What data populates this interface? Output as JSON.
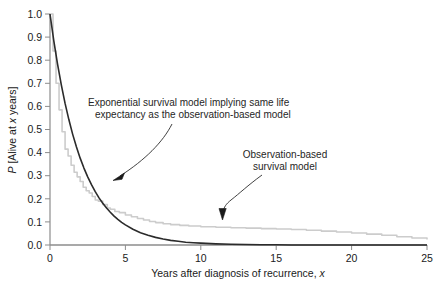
{
  "chart_data": {
    "type": "line",
    "title": "",
    "subtitle": "",
    "xlabel": "Years after diagnosis of recurrence, x",
    "ylabel": "P [Alive at x years]",
    "xlabel_parts": {
      "main": "Years after diagnosis of recurrence, ",
      "italic": "x"
    },
    "ylabel_parts": {
      "p": "P",
      "mid": " [Alive at ",
      "italic": "x",
      "end": " years]"
    },
    "xlim": [
      0,
      25
    ],
    "ylim": [
      0,
      1.0
    ],
    "xticks": [
      0,
      5,
      10,
      15,
      20,
      25
    ],
    "xtick_labels": [
      "0",
      "5",
      "10",
      "15",
      "20",
      "25"
    ],
    "yticks": [
      0.0,
      0.1,
      0.2,
      0.3,
      0.4,
      0.5,
      0.6,
      0.7,
      0.8,
      0.9,
      1.0
    ],
    "ytick_labels": [
      "0.0",
      "0.1",
      "0.2",
      "0.3",
      "0.4",
      "0.5",
      "0.6",
      "0.7",
      "0.8",
      "0.9",
      "1.0"
    ],
    "grid": false,
    "legend": "none",
    "series": [
      {
        "name": "Exponential survival model implying same life expectancy as the observation-based model",
        "color": "#2b2b2b",
        "style": "solid",
        "width": 1.6,
        "x": [
          0,
          0.25,
          0.5,
          0.75,
          1,
          1.25,
          1.5,
          1.75,
          2,
          2.25,
          2.5,
          2.75,
          3,
          3.25,
          3.5,
          3.75,
          4,
          4.25,
          4.5,
          4.75,
          5,
          5.5,
          6,
          6.5,
          7,
          7.5,
          8,
          8.5,
          9,
          9.5,
          10,
          11,
          12,
          13,
          14,
          15,
          16,
          17,
          18,
          19,
          20,
          21,
          22,
          23,
          24,
          25
        ],
        "y": [
          1.0,
          0.885,
          0.783,
          0.693,
          0.613,
          0.543,
          0.48,
          0.425,
          0.376,
          0.333,
          0.295,
          0.261,
          0.231,
          0.204,
          0.181,
          0.16,
          0.142,
          0.125,
          0.111,
          0.098,
          0.087,
          0.068,
          0.053,
          0.042,
          0.033,
          0.026,
          0.02,
          0.016,
          0.012,
          0.01,
          0.008,
          0.005,
          0.003,
          0.002,
          0.001,
          0.001,
          0.0,
          0.0,
          0.0,
          0.0,
          0.0,
          0.0,
          0.0,
          0.0,
          0.0,
          0.0
        ]
      },
      {
        "name": "Observation-based survival model",
        "color": "#cccccc",
        "style": "step",
        "width": 1.6,
        "x": [
          0,
          0.2,
          0.4,
          0.6,
          0.8,
          1.0,
          1.2,
          1.4,
          1.6,
          1.8,
          2.0,
          2.2,
          2.4,
          2.6,
          2.8,
          3.0,
          3.2,
          3.5,
          3.8,
          4.0,
          4.3,
          4.6,
          5.0,
          5.4,
          5.8,
          6.2,
          6.6,
          7.0,
          7.5,
          8.0,
          8.6,
          9.2,
          10.0,
          11.0,
          12.0,
          13.0,
          14.0,
          15.0,
          16.0,
          17.0,
          18.0,
          19.0,
          20.0,
          21.0,
          22.0,
          23.0,
          24.0,
          25.0
        ],
        "y": [
          1.0,
          0.84,
          0.7,
          0.585,
          0.49,
          0.415,
          0.385,
          0.345,
          0.315,
          0.295,
          0.275,
          0.25,
          0.235,
          0.225,
          0.21,
          0.195,
          0.19,
          0.175,
          0.16,
          0.155,
          0.145,
          0.14,
          0.13,
          0.122,
          0.115,
          0.108,
          0.102,
          0.097,
          0.092,
          0.088,
          0.085,
          0.082,
          0.079,
          0.077,
          0.075,
          0.073,
          0.071,
          0.069,
          0.067,
          0.064,
          0.06,
          0.056,
          0.052,
          0.047,
          0.042,
          0.036,
          0.03,
          0.024
        ]
      }
    ],
    "annotations": [
      {
        "id": "exponential-annotation",
        "line1": "Exponential survival model implying same life",
        "line2": "expectancy as the observation-based model",
        "target": "exponential curve"
      },
      {
        "id": "observation-annotation",
        "line1": "Observation-based",
        "line2": "survival model",
        "target": "observation-based curve"
      }
    ]
  },
  "colors": {
    "exponential_curve": "#2b2b2b",
    "observation_curve": "#cccccc",
    "axis": "#808080",
    "text": "#1a1a1a",
    "background": "#ffffff"
  }
}
